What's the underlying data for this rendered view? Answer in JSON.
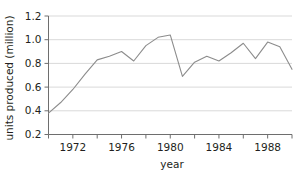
{
  "chart_data": {
    "type": "line",
    "title": "",
    "xlabel": "year",
    "ylabel": "units produced (million)",
    "xlim": [
      1970,
      1990
    ],
    "ylim": [
      0.2,
      1.2
    ],
    "grid": true,
    "grid_axis": "y",
    "legend": "none",
    "line_color": "#8c8c8c",
    "text_color": "#231f20",
    "grid_color": "#d9d9d9",
    "axis_color": "#6e6e6e",
    "x_tick_values": [
      1970,
      1972,
      1974,
      1976,
      1978,
      1980,
      1982,
      1984,
      1986,
      1988,
      1990
    ],
    "x_tick_labels": [
      "",
      "1972",
      "",
      "1976",
      "",
      "1980",
      "",
      "1984",
      "",
      "1988",
      ""
    ],
    "y_tick_values": [
      0.2,
      0.4,
      0.6,
      0.8,
      1.0,
      1.2
    ],
    "y_tick_labels": [
      "0.2",
      "0.4",
      "0.6",
      "0.8",
      "1.0",
      "1.2"
    ],
    "x": [
      1970,
      1971,
      1972,
      1973,
      1974,
      1975,
      1976,
      1977,
      1978,
      1979,
      1980,
      1981,
      1982,
      1983,
      1984,
      1985,
      1986,
      1987,
      1988,
      1989,
      1990
    ],
    "values": [
      0.38,
      0.47,
      0.58,
      0.71,
      0.83,
      0.86,
      0.9,
      0.82,
      0.95,
      1.02,
      1.04,
      0.69,
      0.81,
      0.86,
      0.82,
      0.89,
      0.97,
      0.84,
      0.98,
      0.94,
      0.75
    ],
    "series": [
      {
        "name": "units produced",
        "values": [
          0.38,
          0.47,
          0.58,
          0.71,
          0.83,
          0.86,
          0.9,
          0.82,
          0.95,
          1.02,
          1.04,
          0.69,
          0.81,
          0.86,
          0.82,
          0.89,
          0.97,
          0.84,
          0.98,
          0.94,
          0.75
        ]
      }
    ]
  }
}
